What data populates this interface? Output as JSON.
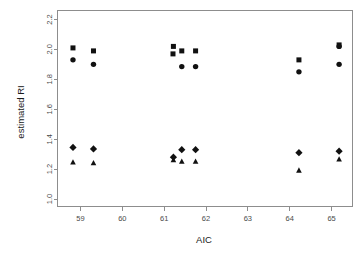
{
  "figure": {
    "background": "#ffffff",
    "marker_color": "#111111",
    "axis_color": "#8d8d8d",
    "text_color": "#1a1a1a"
  },
  "chart_data": {
    "type": "scatter",
    "title": "",
    "xlabel": "AIC",
    "ylabel": "estimated RI",
    "xlim": [
      58.45,
      65.5
    ],
    "ylim": [
      0.95,
      2.26
    ],
    "xticks": [
      59,
      60,
      61,
      62,
      63,
      64,
      65
    ],
    "xticklabels": [
      "59",
      "60",
      "61",
      "62",
      "63",
      "64",
      "65"
    ],
    "yticks": [
      1.0,
      1.2,
      1.4,
      1.6,
      1.8,
      2.0,
      2.2
    ],
    "yticklabels": [
      "1.0",
      "1.2",
      "1.4",
      "1.6",
      "1.8",
      "2.0",
      "2.2"
    ],
    "grid": false,
    "legend": "none",
    "series": [
      {
        "name": "square",
        "marker": "square",
        "points": [
          {
            "x": 58.82,
            "y": 2.01
          },
          {
            "x": 59.31,
            "y": 1.99
          },
          {
            "x": 61.22,
            "y": 2.02
          },
          {
            "x": 61.21,
            "y": 1.97
          },
          {
            "x": 61.42,
            "y": 1.99
          },
          {
            "x": 61.75,
            "y": 1.99
          },
          {
            "x": 64.22,
            "y": 1.93
          },
          {
            "x": 65.18,
            "y": 2.03
          }
        ]
      },
      {
        "name": "circle",
        "marker": "circle",
        "points": [
          {
            "x": 58.82,
            "y": 1.93
          },
          {
            "x": 59.31,
            "y": 1.9
          },
          {
            "x": 61.42,
            "y": 1.885
          },
          {
            "x": 61.75,
            "y": 1.885
          },
          {
            "x": 64.22,
            "y": 1.85
          },
          {
            "x": 65.18,
            "y": 2.02
          },
          {
            "x": 65.18,
            "y": 1.9
          }
        ]
      },
      {
        "name": "diamond",
        "marker": "diamond",
        "points": [
          {
            "x": 58.82,
            "y": 1.345
          },
          {
            "x": 59.31,
            "y": 1.335
          },
          {
            "x": 61.22,
            "y": 1.28
          },
          {
            "x": 61.42,
            "y": 1.33
          },
          {
            "x": 61.75,
            "y": 1.33
          },
          {
            "x": 64.22,
            "y": 1.31
          },
          {
            "x": 65.18,
            "y": 1.32
          }
        ]
      },
      {
        "name": "triangle",
        "marker": "triangle",
        "points": [
          {
            "x": 58.82,
            "y": 1.245
          },
          {
            "x": 59.31,
            "y": 1.24
          },
          {
            "x": 61.22,
            "y": 1.26
          },
          {
            "x": 61.42,
            "y": 1.25
          },
          {
            "x": 61.75,
            "y": 1.25
          },
          {
            "x": 64.22,
            "y": 1.19
          },
          {
            "x": 65.18,
            "y": 1.265
          }
        ]
      }
    ]
  }
}
